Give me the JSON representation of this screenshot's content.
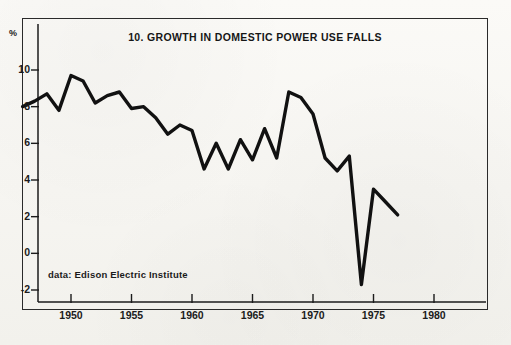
{
  "figure": {
    "title": "10. GROWTH IN DOMESTIC POWER USE FALLS",
    "percent_symbol": "%",
    "source_note": "data:  Edison Electric Institute",
    "line_color": "#111111",
    "frame_color": "#2a2a2a",
    "background_color": "#faf9f6"
  },
  "chart_data": {
    "type": "line",
    "title": "10. GROWTH IN DOMESTIC POWER USE FALLS",
    "subtitle": "",
    "xlabel": "",
    "ylabel": "%",
    "annotations": [
      "data:  Edison Electric Institute"
    ],
    "legend": [],
    "legend_position": "none",
    "grid": false,
    "xlim": [
      1946,
      1982
    ],
    "ylim": [
      -3,
      11
    ],
    "xticks": [
      1950,
      1955,
      1960,
      1965,
      1970,
      1975,
      1980
    ],
    "xtick_labels": [
      "1950",
      "1955",
      "1960",
      "1965",
      "1970",
      "1975",
      "1980"
    ],
    "yticks": [
      -2,
      0,
      2,
      4,
      6,
      8,
      10
    ],
    "ytick_labels": [
      "-2",
      "0",
      "2",
      "4",
      "6",
      "8",
      "10"
    ],
    "series": [
      {
        "name": "Growth in domestic power use",
        "x": [
          1946,
          1947,
          1948,
          1949,
          1950,
          1951,
          1952,
          1953,
          1954,
          1955,
          1956,
          1957,
          1958,
          1959,
          1960,
          1961,
          1962,
          1963,
          1964,
          1965,
          1966,
          1967,
          1968,
          1969,
          1970,
          1971,
          1972,
          1973,
          1974,
          1975,
          1976,
          1977
        ],
        "values": [
          8.0,
          8.3,
          8.7,
          7.8,
          9.7,
          9.4,
          8.2,
          8.6,
          8.8,
          7.9,
          8.0,
          7.4,
          6.5,
          7.0,
          6.7,
          4.6,
          6.0,
          4.6,
          6.2,
          5.1,
          6.8,
          5.2,
          8.8,
          8.5,
          7.6,
          5.2,
          4.5,
          5.3,
          -1.7,
          3.5,
          2.8,
          2.1
        ]
      }
    ]
  }
}
